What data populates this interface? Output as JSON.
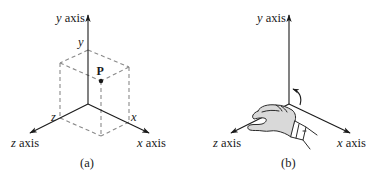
{
  "figure": {
    "panels": [
      {
        "id": "a",
        "caption": "(a)",
        "axes": {
          "y_var": "y",
          "y_word": " axis",
          "z_var": "z",
          "z_word": " axis",
          "x_var": "x",
          "x_word": " axis"
        },
        "tick_labels": {
          "y": "y",
          "z": "z",
          "x": "x"
        },
        "point_label": "P"
      },
      {
        "id": "b",
        "caption": "(b)",
        "axes": {
          "y_var": "y",
          "y_word": " axis",
          "z_var": "z",
          "z_word": " axis",
          "x_var": "x",
          "x_word": " axis"
        },
        "illustration": "right-hand-rule-hand"
      }
    ],
    "colors": {
      "axis": "#1a1a1a",
      "dashed_box": "#8a8a8a",
      "hand_fill": "#d9d9d9",
      "hand_stroke": "#2a2a2a"
    }
  }
}
